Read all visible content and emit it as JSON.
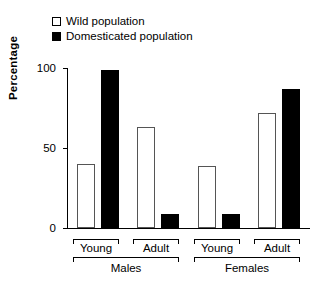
{
  "chart_data": {
    "type": "bar",
    "title": "",
    "xlabel": "",
    "ylabel": "Percentage",
    "ylim": [
      0,
      100
    ],
    "yticks": [
      0,
      50,
      100
    ],
    "ytick_labels": [
      "0",
      "50",
      "100"
    ],
    "grid": false,
    "legend_position": "top-left",
    "categories": [
      "Young",
      "Adult",
      "Young",
      "Adult"
    ],
    "groups": [
      {
        "name": "Males",
        "subgroups": [
          {
            "label": "Young",
            "wild": 40,
            "domesticated": 99
          },
          {
            "label": "Adult",
            "wild": 63,
            "domesticated": 9
          }
        ]
      },
      {
        "name": "Females",
        "subgroups": [
          {
            "label": "Young",
            "wild": 39,
            "domesticated": 9
          },
          {
            "label": "Adult",
            "wild": 72,
            "domesticated": 87
          }
        ]
      }
    ],
    "series": [
      {
        "name": "Wild population",
        "color": "#ffffff",
        "values": [
          40,
          63,
          39,
          72
        ]
      },
      {
        "name": "Domesticated population",
        "color": "#000000",
        "values": [
          99,
          9,
          9,
          87
        ]
      }
    ]
  },
  "legend": {
    "items": [
      {
        "label": "Wild population",
        "swatch": "open-square-swatch"
      },
      {
        "label": "Domesticated population",
        "swatch": "filled-square-swatch"
      }
    ]
  },
  "axes": {
    "y": {
      "label": "Percentage",
      "ticks": [
        "0",
        "50",
        "100"
      ]
    },
    "x": {
      "sub_labels": [
        "Young",
        "Adult",
        "Young",
        "Adult"
      ],
      "main_labels": [
        "Males",
        "Females"
      ]
    }
  }
}
